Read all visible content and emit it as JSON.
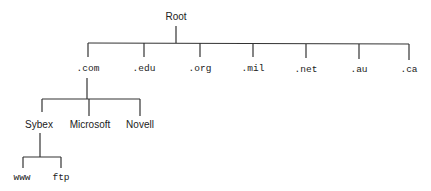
{
  "diagram": {
    "type": "tree",
    "root": {
      "label": "Root"
    },
    "tlds": [
      {
        "label": ".com"
      },
      {
        "label": ".edu"
      },
      {
        "label": ".org"
      },
      {
        "label": ".mil"
      },
      {
        "label": ".net"
      },
      {
        "label": ".au"
      },
      {
        "label": ".ca"
      }
    ],
    "com_children": [
      {
        "label": "Sybex"
      },
      {
        "label": "Microsoft"
      },
      {
        "label": "Novell"
      }
    ],
    "sybex_children": [
      {
        "label": "www"
      },
      {
        "label": "ftp"
      }
    ],
    "line_color": "#333333"
  }
}
